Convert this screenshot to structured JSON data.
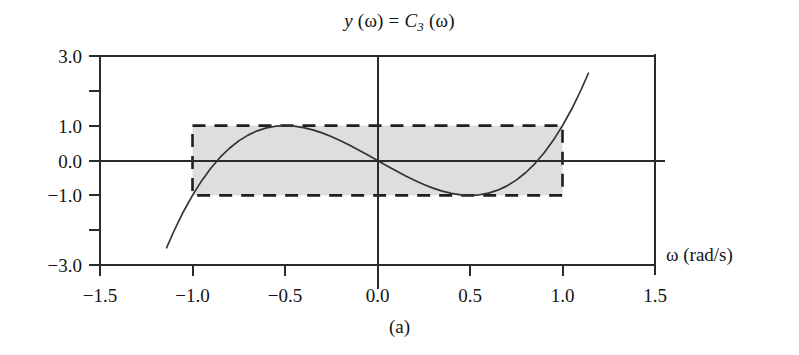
{
  "figure": {
    "caption": "(a)",
    "title_prefix": "y",
    "title_arg1": " (ω) = ",
    "title_symbol": "C",
    "title_subscript": "3",
    "title_arg2": " (ω)"
  },
  "chart_data": {
    "type": "line",
    "title": "y (ω) = C3 (ω)",
    "xlabel": "ω (rad/s)",
    "ylabel": "",
    "xlim": [
      -1.5,
      1.5
    ],
    "ylim": [
      -3.0,
      3.0
    ],
    "grid": false,
    "legend": null,
    "x_ticks": [
      -1.5,
      -1.0,
      -0.5,
      0.0,
      0.5,
      1.0,
      1.5
    ],
    "x_tick_labels": [
      "−1.5",
      "−1.0",
      "−0.5",
      "0.0",
      "0.5",
      "1.0",
      "1.5"
    ],
    "y_ticks": [
      -3.0,
      -2.0,
      -1.0,
      0.0,
      1.0,
      2.0,
      3.0
    ],
    "y_tick_labels": [
      "−3.0",
      "",
      "−1.0",
      "0.0",
      "1.0",
      "",
      "3.0"
    ],
    "function": "C3(w) = 4w^3 - 3w",
    "series": [
      {
        "name": "C3(ω)",
        "color": "#333333",
        "x": [
          -1.14,
          -1.1,
          -1.05,
          -1.0,
          -0.95,
          -0.9,
          -0.85,
          -0.8,
          -0.75,
          -0.7,
          -0.65,
          -0.6,
          -0.55,
          -0.5,
          -0.45,
          -0.4,
          -0.35,
          -0.3,
          -0.25,
          -0.2,
          -0.15,
          -0.1,
          -0.05,
          0.0,
          0.05,
          0.1,
          0.15,
          0.2,
          0.25,
          0.3,
          0.35,
          0.4,
          0.45,
          0.5,
          0.55,
          0.6,
          0.65,
          0.7,
          0.75,
          0.8,
          0.85,
          0.9,
          0.95,
          1.0,
          1.05,
          1.1,
          1.14
        ],
        "y": [
          -2.505,
          -2.024,
          -1.478,
          -1.0,
          -0.579,
          -0.216,
          0.094,
          0.352,
          0.563,
          0.728,
          0.852,
          0.936,
          0.984,
          1.0,
          0.986,
          0.944,
          0.879,
          0.792,
          0.688,
          0.568,
          0.437,
          0.296,
          0.15,
          0.0,
          -0.15,
          -0.296,
          -0.437,
          -0.568,
          -0.688,
          -0.792,
          -0.879,
          -0.944,
          -0.986,
          -1.0,
          -0.984,
          -0.936,
          -0.852,
          -0.728,
          -0.563,
          -0.352,
          -0.094,
          0.216,
          0.579,
          1.0,
          1.478,
          2.024,
          2.505
        ]
      }
    ],
    "shaded_region": {
      "label": "equiripple band",
      "x_range": [
        -1.0,
        1.0
      ],
      "y_range": [
        -1.0,
        1.0
      ],
      "fill_color": "#dcdcdc",
      "border_style": "dashed",
      "border_color": "#1f1f1f"
    },
    "annotations": [
      {
        "name": "x-axis-unit-label",
        "text": "ω (rad/s)",
        "x": 1.62,
        "y": 0.0
      },
      {
        "name": "subfigure-caption",
        "text": "(a)",
        "x": 0.0,
        "y": -3.8
      }
    ]
  }
}
